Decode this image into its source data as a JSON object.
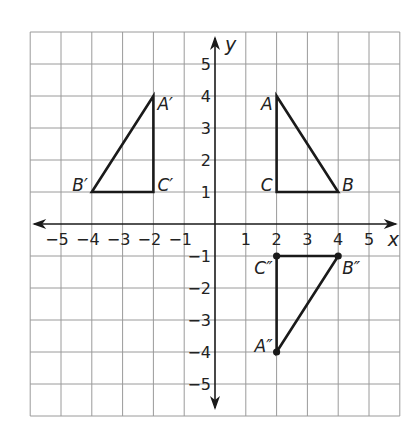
{
  "diagram": {
    "type": "coordinate-plane",
    "x_axis_label": "x",
    "y_axis_label": "y",
    "x_range": [
      -6,
      6
    ],
    "y_range": [
      -6,
      6
    ],
    "x_ticks": [
      {
        "value": -5,
        "label": "−5"
      },
      {
        "value": -4,
        "label": "−4"
      },
      {
        "value": -3,
        "label": "−3"
      },
      {
        "value": -2,
        "label": "−2"
      },
      {
        "value": -1,
        "label": "−1"
      },
      {
        "value": 1,
        "label": "1"
      },
      {
        "value": 2,
        "label": "2"
      },
      {
        "value": 3,
        "label": "3"
      },
      {
        "value": 4,
        "label": "4"
      },
      {
        "value": 5,
        "label": "5"
      }
    ],
    "y_ticks": [
      {
        "value": 5,
        "label": "5"
      },
      {
        "value": 4,
        "label": "4"
      },
      {
        "value": 3,
        "label": "3"
      },
      {
        "value": 2,
        "label": "2"
      },
      {
        "value": 1,
        "label": "1"
      },
      {
        "value": -1,
        "label": "−1"
      },
      {
        "value": -2,
        "label": "−2"
      },
      {
        "value": -3,
        "label": "−3"
      },
      {
        "value": -4,
        "label": "−4"
      },
      {
        "value": -5,
        "label": "−5"
      }
    ],
    "triangles": [
      {
        "name": "ABC",
        "dots": false,
        "vertices": [
          {
            "label": "A",
            "x": 2,
            "y": 4,
            "label_side": "left"
          },
          {
            "label": "B",
            "x": 4,
            "y": 1,
            "label_side": "right"
          },
          {
            "label": "C",
            "x": 2,
            "y": 1,
            "label_side": "left"
          }
        ]
      },
      {
        "name": "A'B'C'",
        "dots": false,
        "vertices": [
          {
            "label": "A′",
            "x": -2,
            "y": 4,
            "label_side": "right"
          },
          {
            "label": "B′",
            "x": -4,
            "y": 1,
            "label_side": "left"
          },
          {
            "label": "C′",
            "x": -2,
            "y": 1,
            "label_side": "right"
          }
        ]
      },
      {
        "name": "A''B''C''",
        "dots": true,
        "vertices": [
          {
            "label": "A″",
            "x": 2,
            "y": -4,
            "label_side": "left"
          },
          {
            "label": "B″",
            "x": 4,
            "y": -1,
            "label_side": "right"
          },
          {
            "label": "C″",
            "x": 2,
            "y": -1,
            "label_side": "left"
          }
        ]
      }
    ]
  }
}
